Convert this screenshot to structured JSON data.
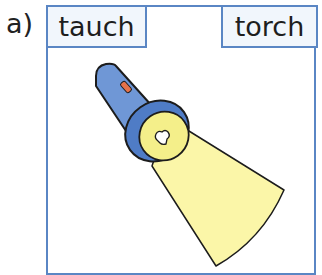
{
  "item": {
    "label": "a)"
  },
  "options": {
    "left": {
      "text": "tauch"
    },
    "right": {
      "text": "torch"
    }
  },
  "illustration": {
    "subject": "flashlight-icon",
    "colors": {
      "body": "#6f97d6",
      "head": "#4f7cc6",
      "switch": "#e5724a",
      "beam": "#fbf6a8",
      "lens": "#f4ef8a",
      "outline": "#1c1c1c",
      "border": "#5a86c4"
    }
  }
}
